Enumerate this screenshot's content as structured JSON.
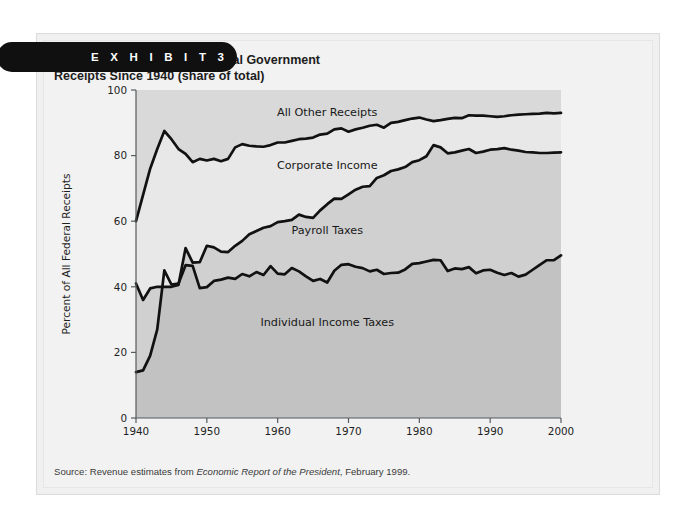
{
  "exhibit": {
    "badge_label": "E X H I B I T   3",
    "title": "Percent Composition of Federal Government\nReceipts Since 1940 (share of total)",
    "source_prefix": "Source: Revenue estimates from ",
    "source_italic": "Economic Report of the President",
    "source_suffix": ", February 1999."
  },
  "colors": {
    "badge_bg": "#101010",
    "panel_bg": "#f2f2f2",
    "line": "#111111",
    "band_all_other": "#d9d9d9",
    "band_corporate": "#e8e8e8",
    "band_payroll": "#d0d0d0",
    "band_individual": "#c2c2c2",
    "axis": "#555b5e",
    "text": "#1f1f1f"
  },
  "chart_data": {
    "type": "area",
    "title": "Percent Composition of Federal Government Receipts Since 1940 (share of total)",
    "xlabel": "",
    "ylabel": "Percent of All Federal Receipts",
    "xlim": [
      1940,
      2000
    ],
    "ylim": [
      0,
      100
    ],
    "grid": false,
    "legend_position": "inline-annotations",
    "xticks": [
      1940,
      1950,
      1960,
      1970,
      1980,
      1990,
      2000
    ],
    "yticks": [
      0,
      20,
      40,
      60,
      80,
      100
    ],
    "annotations": [
      {
        "text": "All Other Receipts",
        "x": 1967,
        "y": 92
      },
      {
        "text": "Corporate Income",
        "x": 1967,
        "y": 76
      },
      {
        "text": "Payroll Taxes",
        "x": 1967,
        "y": 56
      },
      {
        "text": "Individual Income Taxes",
        "x": 1967,
        "y": 28
      }
    ],
    "x": [
      1940,
      1941,
      1942,
      1943,
      1944,
      1945,
      1946,
      1947,
      1948,
      1949,
      1950,
      1951,
      1952,
      1953,
      1954,
      1955,
      1956,
      1957,
      1958,
      1959,
      1960,
      1961,
      1962,
      1963,
      1964,
      1965,
      1966,
      1967,
      1968,
      1969,
      1970,
      1971,
      1972,
      1973,
      1974,
      1975,
      1976,
      1977,
      1978,
      1979,
      1980,
      1981,
      1982,
      1983,
      1984,
      1985,
      1986,
      1987,
      1988,
      1989,
      1990,
      1991,
      1992,
      1993,
      1994,
      1995,
      1996,
      1997,
      1998,
      1999,
      2000
    ],
    "series": [
      {
        "name": "Individual Income Taxes",
        "description": "cumulative share, bottom boundary line",
        "values": [
          14.0,
          14.5,
          19.0,
          27.0,
          45.0,
          40.7,
          41.0,
          46.6,
          46.4,
          39.6,
          39.9,
          41.8,
          42.2,
          42.8,
          42.4,
          43.9,
          43.2,
          44.5,
          43.6,
          46.3,
          44.0,
          43.8,
          45.7,
          44.7,
          43.2,
          41.8,
          42.4,
          41.3,
          44.9,
          46.7,
          46.9,
          46.1,
          45.7,
          44.7,
          45.2,
          43.9,
          44.2,
          44.3,
          45.3,
          47.0,
          47.2,
          47.7,
          48.2,
          48.1,
          44.8,
          45.6,
          45.4,
          46.0,
          44.1,
          45.0,
          45.2,
          44.3,
          43.6,
          44.2,
          43.1,
          43.7,
          45.2,
          46.7,
          48.1,
          48.1,
          49.6
        ]
      },
      {
        "name": "Payroll Taxes",
        "description": "cumulative share (individual + payroll), middle boundary line",
        "values": [
          41.0,
          36.0,
          39.5,
          40.0,
          40.0,
          40.0,
          40.6,
          51.8,
          47.4,
          47.5,
          52.5,
          52.0,
          50.7,
          50.6,
          52.5,
          54.0,
          56.0,
          57.0,
          58.0,
          58.5,
          59.7,
          60.0,
          60.4,
          62.0,
          61.3,
          61.0,
          63.3,
          65.2,
          66.9,
          66.8,
          68.2,
          69.6,
          70.5,
          70.7,
          73.2,
          74.0,
          75.3,
          75.8,
          76.5,
          78.0,
          78.6,
          79.8,
          83.2,
          82.5,
          80.7,
          81.0,
          81.5,
          82.0,
          80.8,
          81.2,
          81.8,
          82.0,
          82.3,
          81.8,
          81.5,
          81.1,
          81.0,
          80.8,
          80.8,
          80.9,
          81.0
        ]
      },
      {
        "name": "Corporate Income",
        "description": "cumulative share (individual + payroll + corporate), top boundary line",
        "values": [
          60.0,
          68.0,
          76.0,
          82.0,
          87.5,
          85.0,
          82.0,
          80.5,
          78.0,
          79.0,
          78.5,
          79.0,
          78.3,
          79.0,
          82.5,
          83.5,
          83.0,
          82.8,
          82.7,
          83.2,
          84.0,
          84.0,
          84.5,
          85.0,
          85.2,
          85.5,
          86.4,
          86.7,
          88.0,
          88.3,
          87.3,
          88.0,
          88.5,
          89.1,
          89.4,
          88.5,
          90.0,
          90.3,
          90.8,
          91.3,
          91.6,
          91.0,
          90.5,
          90.8,
          91.2,
          91.5,
          91.4,
          92.3,
          92.2,
          92.2,
          92.0,
          91.8,
          92.0,
          92.3,
          92.5,
          92.6,
          92.7,
          92.8,
          93.0,
          92.9,
          93.0
        ]
      }
    ]
  }
}
